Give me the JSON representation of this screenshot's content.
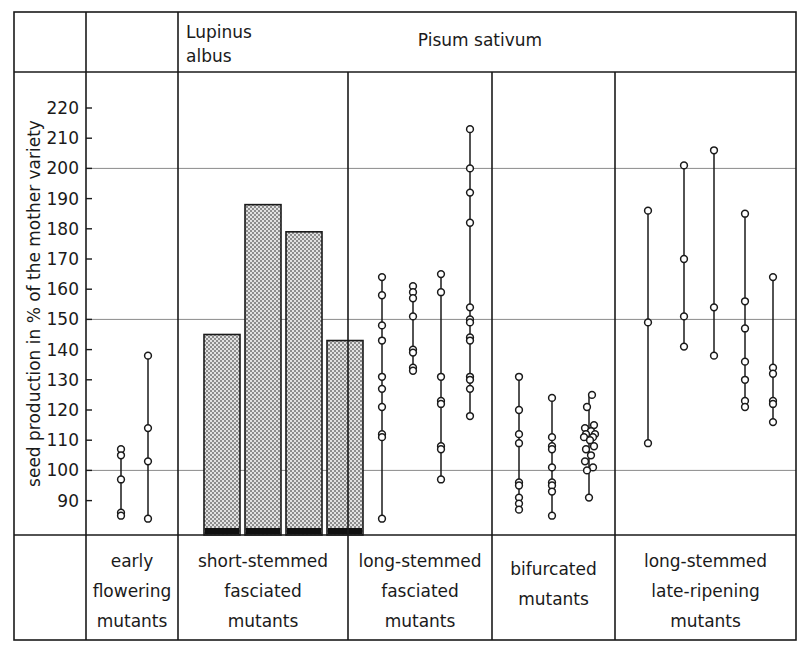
{
  "header": {
    "col1_line1": "Lupinus",
    "col1_line2": "albus",
    "col2": "Pisum sativum"
  },
  "axis": {
    "y_label": "seed production in % of the mother variety",
    "ticks": [
      220,
      210,
      200,
      190,
      180,
      170,
      160,
      150,
      140,
      130,
      120,
      110,
      100,
      90
    ],
    "gridlines": [
      200,
      150,
      100
    ],
    "ymin": 82,
    "ymax": 228
  },
  "footer": {
    "panels": [
      [
        "early",
        "flowering",
        "mutants"
      ],
      [
        "short-stemmed",
        "fasciated",
        "mutants"
      ],
      [
        "long-stemmed",
        "fasciated",
        "mutants"
      ],
      [
        "bifurcated",
        "mutants"
      ],
      [
        "long-stemmed",
        "late-ripening",
        "mutants"
      ]
    ]
  },
  "colors": {
    "frame": "#1a1a1a",
    "grid": "#8a8a8a",
    "bar_fill": "#d8d8d8",
    "bar_stroke": "#1a1a1a",
    "bar_base": "#101010",
    "marker_fill": "#ffffff",
    "marker_stroke": "#1a1a1a"
  },
  "chart_data": {
    "type": "scatter",
    "title": "",
    "xlabel": "",
    "ylabel": "seed production in % of the mother variety",
    "ylim": [
      82,
      228
    ],
    "grid": true,
    "legend": false,
    "panels": [
      {
        "group": "Lupinus albus",
        "category": "early flowering mutants",
        "type": "scatter",
        "series": [
          {
            "name": "line-1",
            "range": [
              85,
              107
            ],
            "values": [
              107,
              105,
              97,
              86,
              85
            ]
          },
          {
            "name": "line-2",
            "range": [
              84,
              138
            ],
            "values": [
              138,
              114,
              103,
              84
            ]
          }
        ]
      },
      {
        "group": "Pisum sativum",
        "category": "short-stemmed fasciated mutants",
        "type": "bar",
        "categories": [
          "bar-1",
          "bar-2",
          "bar-3",
          "bar-4"
        ],
        "values": [
          145,
          188,
          179,
          143
        ]
      },
      {
        "group": "Pisum sativum",
        "category": "long-stemmed fasciated mutants",
        "type": "scatter",
        "series": [
          {
            "name": "line-1",
            "range": [
              84,
              164
            ],
            "values": [
              164,
              158,
              148,
              143,
              131,
              127,
              121,
              112,
              111,
              84
            ]
          },
          {
            "name": "line-2",
            "range": [
              133,
              161
            ],
            "values": [
              161,
              159,
              157,
              151,
              140,
              139,
              134,
              133
            ]
          },
          {
            "name": "line-3",
            "range": [
              97,
              165
            ],
            "values": [
              165,
              159,
              131,
              123,
              122,
              108,
              107,
              97
            ]
          },
          {
            "name": "line-4",
            "range": [
              118,
              213
            ],
            "values": [
              213,
              200,
              192,
              182,
              154,
              150,
              149,
              144,
              143,
              131,
              130,
              127,
              118
            ]
          }
        ]
      },
      {
        "group": "Pisum sativum",
        "category": "bifurcated mutants",
        "type": "scatter",
        "series": [
          {
            "name": "line-1",
            "range": [
              87,
              131
            ],
            "values": [
              131,
              120,
              112,
              109,
              96,
              95,
              91,
              89,
              87
            ]
          },
          {
            "name": "line-2",
            "range": [
              85,
              124
            ],
            "values": [
              124,
              111,
              108,
              107,
              101,
              96,
              95,
              93,
              85
            ]
          },
          {
            "name": "line-3",
            "range": [
              91,
              125
            ],
            "values": [
              125,
              121,
              115,
              114,
              113,
              112,
              112,
              111,
              111,
              110,
              108,
              107,
              105,
              103,
              101,
              100,
              91
            ]
          }
        ]
      },
      {
        "group": "Pisum sativum",
        "category": "long-stemmed late-ripening mutants",
        "type": "scatter",
        "series": [
          {
            "name": "line-1",
            "range": [
              109,
              186
            ],
            "values": [
              186,
              149,
              109
            ]
          },
          {
            "name": "line-2",
            "range": [
              141,
              201
            ],
            "values": [
              201,
              170,
              151,
              141
            ]
          },
          {
            "name": "line-3",
            "range": [
              138,
              206
            ],
            "values": [
              206,
              154,
              138
            ]
          },
          {
            "name": "line-4",
            "range": [
              121,
              185
            ],
            "values": [
              185,
              156,
              147,
              136,
              130,
              123,
              121
            ]
          },
          {
            "name": "line-5",
            "range": [
              116,
              164
            ],
            "values": [
              164,
              134,
              132,
              123,
              122,
              116
            ]
          }
        ]
      }
    ]
  }
}
